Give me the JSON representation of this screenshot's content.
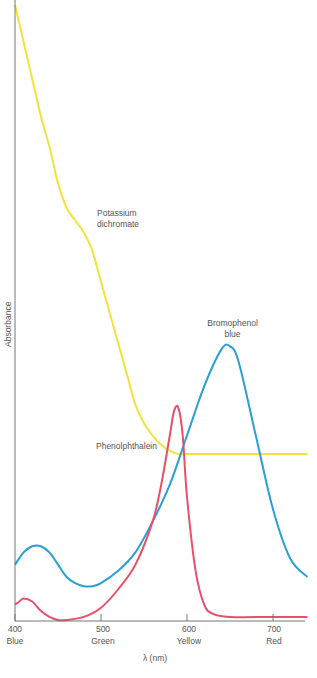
{
  "chart_data": {
    "type": "line",
    "title": "",
    "xlabel": "λ (nm)",
    "ylabel": "Absorbance",
    "xlim": [
      400,
      740
    ],
    "ylim": [
      0,
      100
    ],
    "x_ticks": [
      400,
      500,
      600,
      700
    ],
    "x_tick_labels": [
      {
        "value": "400",
        "color_name": "Blue"
      },
      {
        "value": "500",
        "color_name": "Green"
      },
      {
        "value": "600",
        "color_name": "Yellow"
      },
      {
        "value": "700",
        "color_name": "Red"
      }
    ],
    "grid": false,
    "legend": "inline labels",
    "series": [
      {
        "name": "Potassium dichromate",
        "color": "#f2e33a",
        "x": [
          400,
          410,
          420,
          430,
          440,
          445,
          450,
          460,
          470,
          480,
          490,
          500,
          510,
          520,
          530,
          540,
          550,
          560,
          570,
          580,
          590,
          600,
          650,
          700,
          740
        ],
        "y": [
          100,
          94,
          88,
          82,
          77,
          74,
          71,
          67,
          65,
          63,
          60,
          55,
          50,
          45,
          40,
          35,
          32,
          30,
          28.5,
          27.5,
          27,
          27,
          27,
          27,
          27
        ]
      },
      {
        "name": "Bromophenol blue",
        "color": "#2a9fd6",
        "x": [
          400,
          410,
          420,
          430,
          440,
          450,
          460,
          470,
          480,
          490,
          500,
          520,
          540,
          560,
          580,
          600,
          620,
          640,
          650,
          660,
          680,
          700,
          720,
          740
        ],
        "y": [
          9,
          11,
          12,
          12,
          11,
          9,
          7,
          6,
          5.5,
          5.5,
          6,
          8,
          11,
          16,
          22,
          30,
          38,
          44,
          44.5,
          42,
          30,
          18,
          10,
          7
        ]
      },
      {
        "name": "Phenolphthalein",
        "color": "#e8506a",
        "x": [
          400,
          405,
          410,
          420,
          430,
          440,
          450,
          460,
          480,
          500,
          520,
          540,
          560,
          570,
          580,
          585,
          590,
          595,
          600,
          610,
          620,
          630,
          650,
          700,
          740
        ],
        "y": [
          2.5,
          3,
          3.5,
          3,
          1.5,
          0.5,
          0,
          0,
          0.5,
          2,
          5,
          9,
          16,
          22,
          30,
          34,
          34.5,
          30,
          20,
          8,
          2.5,
          1,
          0.5,
          0.5,
          0.5
        ]
      }
    ],
    "annotations": [
      {
        "text": "Potassium dichromate",
        "x": 470,
        "y": 68
      },
      {
        "text": "Bromophenol blue",
        "x": 650,
        "y": 52
      },
      {
        "text": "Phenolphthalein",
        "x": 530,
        "y": 27
      }
    ]
  },
  "labels": {
    "ylabel": "Absorbance",
    "xlabel": "λ (nm)",
    "potassium_l1": "Potassium",
    "potassium_l2": "dichromate",
    "bromo_l1": "Bromophenol",
    "bromo_l2": "blue",
    "phenol": "Phenolphthalein",
    "t400": "400",
    "c400": "Blue",
    "t500": "500",
    "c500": "Green",
    "t600": "600",
    "c600": "Yellow",
    "t700": "700",
    "c700": "Red"
  }
}
